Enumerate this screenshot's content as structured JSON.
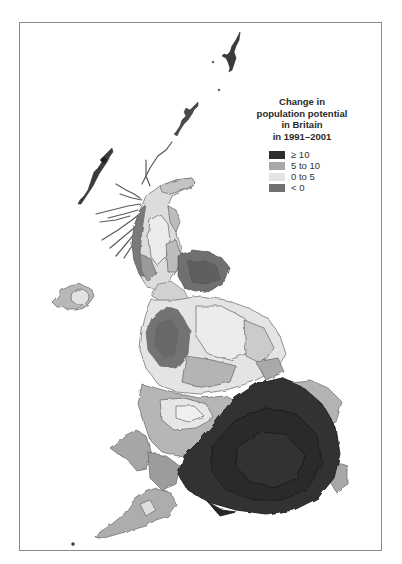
{
  "figure": {
    "type": "cartogram"
  },
  "legend": {
    "title_lines": [
      "Change in",
      "population potential",
      "in Britain",
      "in 1991–2001"
    ],
    "items": [
      {
        "label": "≥ 10",
        "color": "#2e2e2e"
      },
      {
        "label": "5 to 10",
        "color": "#a9a9a9"
      },
      {
        "label": "0 to 5",
        "color": "#e4e4e4"
      },
      {
        "label": "< 0",
        "color": "#707070"
      }
    ]
  },
  "colors": {
    "frame": "#8a8a8a",
    "background": "#ffffff",
    "outline": "#555555"
  }
}
